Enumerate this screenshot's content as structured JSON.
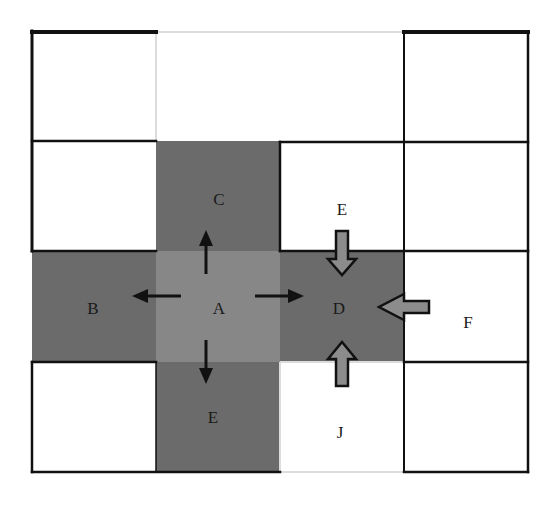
{
  "diagram": {
    "type": "grid-neighborhood",
    "grid": {
      "columns": 4,
      "rows": 4,
      "x_lines": [
        32,
        156,
        280,
        404,
        528
      ],
      "y_lines": [
        31,
        141,
        251,
        362,
        472
      ]
    },
    "colors": {
      "dark_cell": "#6b6b6b",
      "center_cell": "#878787",
      "white_cell": "#ffffff",
      "border": "#111111",
      "faint_border": "#dcdcdc",
      "block_arrow_fill": "#8c8c8c",
      "block_arrow_outline": "#111111",
      "solid_arrow": "#111111"
    },
    "cells": [
      {
        "id": "r0c0",
        "row": 0,
        "col": 0,
        "fill": "white",
        "label": ""
      },
      {
        "id": "r0c1",
        "row": 0,
        "col": 1,
        "fill": "white",
        "label": ""
      },
      {
        "id": "r0c2",
        "row": 0,
        "col": 2,
        "fill": "white",
        "label": ""
      },
      {
        "id": "r0c3",
        "row": 0,
        "col": 3,
        "fill": "white",
        "label": ""
      },
      {
        "id": "r1c0",
        "row": 1,
        "col": 0,
        "fill": "white",
        "label": ""
      },
      {
        "id": "r1c1",
        "row": 1,
        "col": 1,
        "fill": "dark",
        "label": "C"
      },
      {
        "id": "r1c2",
        "row": 1,
        "col": 2,
        "fill": "white",
        "label": "E"
      },
      {
        "id": "r1c3",
        "row": 1,
        "col": 3,
        "fill": "white",
        "label": ""
      },
      {
        "id": "r2c0",
        "row": 2,
        "col": 0,
        "fill": "dark",
        "label": "B"
      },
      {
        "id": "r2c1",
        "row": 2,
        "col": 1,
        "fill": "center",
        "label": "A"
      },
      {
        "id": "r2c2",
        "row": 2,
        "col": 2,
        "fill": "dark",
        "label": "D"
      },
      {
        "id": "r2c3",
        "row": 2,
        "col": 3,
        "fill": "white",
        "label": "F"
      },
      {
        "id": "r3c0",
        "row": 3,
        "col": 0,
        "fill": "white",
        "label": ""
      },
      {
        "id": "r3c1",
        "row": 3,
        "col": 1,
        "fill": "dark",
        "label": "E"
      },
      {
        "id": "r3c2",
        "row": 3,
        "col": 2,
        "fill": "white",
        "label": "J"
      },
      {
        "id": "r3c3",
        "row": 3,
        "col": 3,
        "fill": "white",
        "label": ""
      }
    ],
    "labels": {
      "A": "A",
      "B": "B",
      "C": "C",
      "D": "D",
      "E_top": "E",
      "E_bottom": "E",
      "F": "F",
      "J": "J"
    },
    "outgoing_arrows_from_A": [
      {
        "direction": "up",
        "to": "C"
      },
      {
        "direction": "left",
        "to": "B"
      },
      {
        "direction": "right",
        "to": "D"
      },
      {
        "direction": "down",
        "to": "E"
      }
    ],
    "incoming_arrows_to_D": [
      {
        "direction": "down",
        "from": "E"
      },
      {
        "direction": "left",
        "from": "F"
      },
      {
        "direction": "up",
        "from": "J"
      }
    ]
  }
}
